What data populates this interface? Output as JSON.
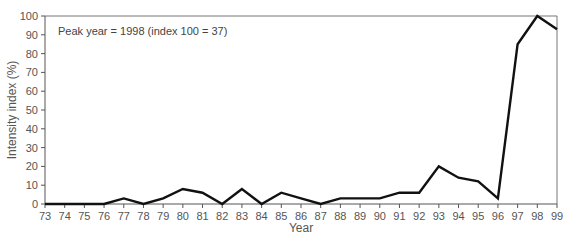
{
  "chart_data": {
    "type": "line",
    "title": "",
    "annotation": "Peak year = 1998 (index 100 = 37)",
    "xlabel": "Year",
    "ylabel": "Intensity index (%)",
    "categories": [
      "73",
      "74",
      "75",
      "76",
      "77",
      "78",
      "79",
      "80",
      "81",
      "82",
      "83",
      "84",
      "85",
      "86",
      "87",
      "88",
      "89",
      "90",
      "91",
      "92",
      "93",
      "94",
      "95",
      "96",
      "97",
      "98",
      "99"
    ],
    "series": [
      {
        "name": "Intensity index",
        "values": [
          0,
          0,
          0,
          0,
          3,
          0,
          3,
          8,
          6,
          0,
          8,
          0,
          6,
          3,
          0,
          3,
          3,
          3,
          6,
          6,
          20,
          14,
          12,
          3,
          85,
          100,
          93
        ]
      }
    ],
    "yticks": [
      0,
      10,
      20,
      30,
      40,
      50,
      60,
      70,
      80,
      90,
      100
    ],
    "ylim": [
      0,
      100
    ],
    "grid": false,
    "legend": "none",
    "line_color": "#111111"
  }
}
